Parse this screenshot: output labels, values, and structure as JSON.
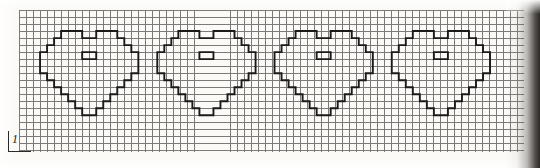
{
  "document": {
    "type": "cross-stitch-chart",
    "title": "Heart Motif Border Chart",
    "scale_label": "1",
    "scale_note": "1"
  },
  "grid": {
    "cell_size_px": 7.02,
    "columns": 72,
    "rows": 20,
    "origin_x_px": 19,
    "origin_y_px": 10,
    "line_color": "#4a4a4a",
    "paper_color": "#fbfaf7",
    "motif_color": "#1a1a1a"
  },
  "chart_data": {
    "type": "heatmap",
    "subtitle": "",
    "xlabel": "",
    "ylabel": "",
    "grid": true,
    "legend": "none",
    "motif_count": 4,
    "motif_name": "heart",
    "motif_width_cells": 16,
    "motif_height_cells": 16,
    "motif_pitch_cells": 16.7,
    "motif_first_origin_cell": [
      2,
      3
    ],
    "categories": [
      "heart-1",
      "heart-2",
      "heart-3",
      "heart-4"
    ],
    "values": [
      1,
      1,
      1,
      1
    ],
    "xlim": [
      0,
      72
    ],
    "ylim": [
      0,
      20
    ],
    "outline_cells_per_motif": 16,
    "heart_outline_path": "M 4,3 L 7,3 L 7,4 L 9,4 L 9,3 L 12,3 L 12,4 L 13,4 L 13,5 L 14,5 L 14,6 L 15,6 L 15,9 L 14,9 L 14,10 L 13,10 L 13,11 L 12,11 L 12,12 L 11,12 L 11,13 L 10,13 L 10,14 L 9,14 L 9,15 L 7,15 L 7,14 L 6,14 L 6,13 L 5,13 L 5,12 L 4,12 L 4,11 L 3,11 L 3,10 L 2,10 L 2,9 L 1,9 L 1,6 L 2,6 L 2,5 L 3,5 L 3,4 L 4,4 Z",
    "heart_inner_cross_path": "M 7,6 L 9,6 L 9,7 L 7,7 Z"
  },
  "hearts": [
    {
      "index": 1,
      "label": "heart-1",
      "origin_cell_x": 2
    },
    {
      "index": 2,
      "label": "heart-2",
      "origin_cell_x": 18.7
    },
    {
      "index": 3,
      "label": "heart-3",
      "origin_cell_x": 35.4
    },
    {
      "index": 4,
      "label": "heart-4",
      "origin_cell_x": 52.1
    }
  ],
  "annotations": {
    "scale_marker": {
      "name": "one-square-scale-marker",
      "text": "1",
      "position": "bottom-left"
    }
  }
}
